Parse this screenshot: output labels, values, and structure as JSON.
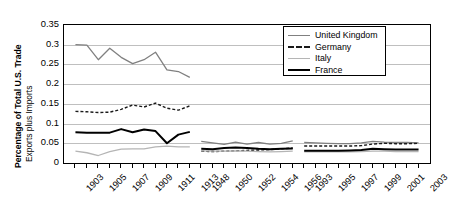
{
  "chart_data": {
    "type": "line",
    "title": "",
    "xlabel": "",
    "ylabel": "Percentage of Total U.S. Trade",
    "ylabel_line2": "Exports plus Imports",
    "ylim": [
      0,
      0.35
    ],
    "ytick_labels": [
      "0.35",
      "0.3",
      "0.25",
      "0.2",
      "0.15",
      "0.1",
      "0.05",
      "0"
    ],
    "ytick_values": [
      0.35,
      0.3,
      0.25,
      0.2,
      0.15,
      0.1,
      0.05,
      0
    ],
    "grid": true,
    "legend_position": "top-right",
    "x_categories": [
      "1903",
      "1904",
      "1905",
      "1906",
      "1907",
      "1908",
      "1909",
      "1910",
      "1911",
      "1912",
      "1913",
      "1948",
      "1949",
      "1950",
      "1951",
      "1952",
      "1953",
      "1954",
      "1955",
      "1956",
      "1993",
      "1994",
      "1995",
      "1996",
      "1997",
      "1998",
      "1999",
      "2000",
      "2001",
      "2002",
      "2003"
    ],
    "xtick_labels_shown": [
      "1903",
      "1905",
      "1907",
      "1909",
      "1911",
      "1913",
      "1948",
      "1950",
      "1952",
      "1954",
      "1956",
      "1993",
      "1995",
      "1997",
      "1999",
      "2001",
      "2003"
    ],
    "segments": [
      {
        "name": "1903-1913",
        "x": [
          "1903",
          "1904",
          "1905",
          "1906",
          "1907",
          "1908",
          "1909",
          "1910",
          "1911",
          "1912",
          "1913"
        ]
      },
      {
        "name": "1948-1956",
        "x": [
          "1948",
          "1949",
          "1950",
          "1951",
          "1952",
          "1953",
          "1954",
          "1955",
          "1956"
        ]
      },
      {
        "name": "1993-2003",
        "x": [
          "1993",
          "1994",
          "1995",
          "1996",
          "1997",
          "1998",
          "1999",
          "2000",
          "2001",
          "2002",
          "2003"
        ]
      }
    ],
    "series": [
      {
        "name": "United Kingdom",
        "color": "#808080",
        "style": "solid",
        "width": 1.3,
        "values": [
          0.3,
          0.299,
          0.262,
          0.291,
          0.268,
          0.252,
          0.262,
          0.281,
          0.236,
          0.232,
          0.217,
          0.055,
          0.051,
          0.047,
          0.053,
          0.048,
          0.052,
          0.048,
          0.05,
          0.056,
          0.052,
          0.051,
          0.05,
          0.049,
          0.049,
          0.051,
          0.055,
          0.053,
          0.052,
          0.052,
          0.051
        ]
      },
      {
        "name": "Germany",
        "color": "#1a1a1a",
        "style": "dashed",
        "width": 1.4,
        "values": [
          0.131,
          0.13,
          0.128,
          0.129,
          0.136,
          0.147,
          0.142,
          0.152,
          0.139,
          0.134,
          0.145,
          0.03,
          0.029,
          0.03,
          0.031,
          0.032,
          0.033,
          0.034,
          0.036,
          0.038,
          0.043,
          0.043,
          0.043,
          0.043,
          0.043,
          0.044,
          0.048,
          0.05,
          0.049,
          0.049,
          0.05
        ]
      },
      {
        "name": "Italy",
        "color": "#b5b5b5",
        "style": "solid",
        "width": 1.3,
        "values": [
          0.03,
          0.026,
          0.019,
          0.029,
          0.035,
          0.036,
          0.036,
          0.041,
          0.043,
          0.041,
          0.041,
          0.031,
          0.03,
          0.03,
          0.031,
          0.03,
          0.029,
          0.028,
          0.029,
          0.03,
          0.028,
          0.028,
          0.028,
          0.028,
          0.028,
          0.029,
          0.03,
          0.03,
          0.029,
          0.029,
          0.029
        ]
      },
      {
        "name": "France",
        "color": "#000000",
        "style": "solid",
        "width": 2.0,
        "values": [
          0.078,
          0.077,
          0.077,
          0.077,
          0.086,
          0.078,
          0.085,
          0.081,
          0.05,
          0.072,
          0.079,
          0.036,
          0.035,
          0.038,
          0.039,
          0.038,
          0.036,
          0.035,
          0.036,
          0.037,
          0.031,
          0.031,
          0.031,
          0.031,
          0.032,
          0.033,
          0.036,
          0.035,
          0.034,
          0.034,
          0.034
        ]
      }
    ]
  },
  "legend": {
    "entries": [
      {
        "label": "United Kingdom"
      },
      {
        "label": "Germany"
      },
      {
        "label": "Italy"
      },
      {
        "label": "France"
      }
    ]
  }
}
